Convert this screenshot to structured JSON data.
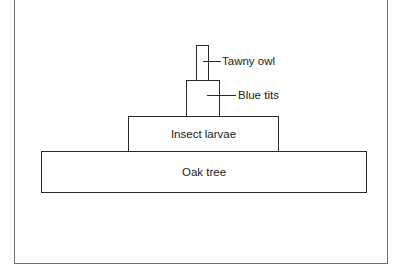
{
  "diagram": {
    "type": "pyramid-of-numbers",
    "levels": [
      {
        "id": "tawny-owl",
        "label": "Tawny owl",
        "trophic_order": 4,
        "label_position": "outside-right"
      },
      {
        "id": "blue-tits",
        "label": "Blue tits",
        "trophic_order": 3,
        "label_position": "outside-right"
      },
      {
        "id": "insect-larvae",
        "label": "Insect larvae",
        "trophic_order": 2,
        "label_position": "inside"
      },
      {
        "id": "oak-tree",
        "label": "Oak tree",
        "trophic_order": 1,
        "label_position": "inside"
      }
    ]
  }
}
